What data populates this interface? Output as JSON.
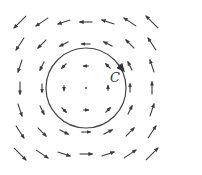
{
  "figure": {
    "type": "vector-field",
    "field": "F(x,y) = (-y, x)",
    "grid": {
      "nx": 7,
      "ny": 7,
      "x_range": [
        -3,
        3
      ],
      "y_range": [
        -3,
        3
      ]
    },
    "curve": {
      "label": "C",
      "shape": "circle",
      "radius": 1.8,
      "orientation": "counterclockwise"
    },
    "colors": {
      "arrow": "#3a3a3a",
      "curve": "#444444",
      "background": "#ffffff"
    }
  }
}
